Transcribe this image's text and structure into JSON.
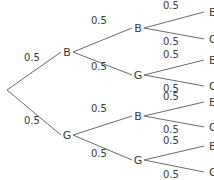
{
  "diagram": {
    "type": "probability-tree",
    "root": {
      "x": 7,
      "y": 90
    },
    "level1": [
      {
        "label": "B",
        "x": 67,
        "y": 52,
        "prob": "0.5",
        "prob_x": 24,
        "prob_y": 61
      },
      {
        "label": "G",
        "x": 67,
        "y": 135,
        "prob": "0.5",
        "prob_x": 24,
        "prob_y": 124
      }
    ],
    "level2": [
      {
        "label": "B",
        "x": 138,
        "y": 28,
        "parent": 0,
        "prob": "0.5",
        "prob_x": 91,
        "prob_y": 24
      },
      {
        "label": "G",
        "x": 138,
        "y": 75,
        "parent": 0,
        "prob": "0.5",
        "prob_x": 91,
        "prob_y": 70
      },
      {
        "label": "B",
        "x": 138,
        "y": 116,
        "parent": 1,
        "prob": "0.5",
        "prob_x": 91,
        "prob_y": 112
      },
      {
        "label": "G",
        "x": 138,
        "y": 160,
        "parent": 1,
        "prob": "0.5",
        "prob_x": 91,
        "prob_y": 157
      }
    ],
    "level3": [
      {
        "label": "B",
        "x": 209,
        "y": 12,
        "parent": 0,
        "prob": "0.5",
        "prob_x": 163,
        "prob_y": 9
      },
      {
        "label": "G",
        "x": 209,
        "y": 39,
        "parent": 0,
        "prob": "0.5",
        "prob_x": 163,
        "prob_y": 45
      },
      {
        "label": "B",
        "x": 209,
        "y": 60,
        "parent": 1,
        "prob": "0.5",
        "prob_x": 163,
        "prob_y": 58
      },
      {
        "label": "G",
        "x": 209,
        "y": 86,
        "parent": 1,
        "prob": "0.5",
        "prob_x": 163,
        "prob_y": 92
      },
      {
        "label": "B",
        "x": 209,
        "y": 102,
        "parent": 2,
        "prob": "0.5",
        "prob_x": 163,
        "prob_y": 100
      },
      {
        "label": "G",
        "x": 209,
        "y": 127,
        "parent": 2,
        "prob": "0.5",
        "prob_x": 163,
        "prob_y": 133
      },
      {
        "label": "B",
        "x": 209,
        "y": 146,
        "parent": 3,
        "prob": "0.5",
        "prob_x": 163,
        "prob_y": 144
      },
      {
        "label": "G",
        "x": 209,
        "y": 172,
        "parent": 3,
        "prob": "0.5",
        "prob_x": 163,
        "prob_y": 178
      }
    ]
  }
}
